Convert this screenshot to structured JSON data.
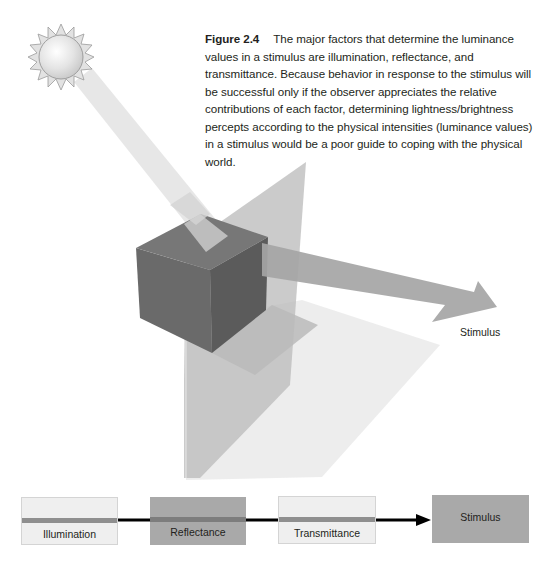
{
  "caption": {
    "figure_label": "Figure 2.4",
    "text": "The major factors that determine the luminance values in a stimulus are illumination, reflectance, and transmittance. Because behavior in response to the stimulus will be successful only if the observer appreciates the relative contributions of each factor, determining lightness/brightness percepts according to the physical intensities (luminance values) in a stimulus would be a poor guide to coping with the physical world."
  },
  "scene": {
    "light_source": "sun-icon",
    "objects": [
      "light-beam",
      "cube",
      "transparent-pane",
      "floor-shadow",
      "stimulus-arrow"
    ],
    "arrow_label": "Stimulus"
  },
  "flow": {
    "boxes": [
      {
        "label": "Illumination",
        "style": "light"
      },
      {
        "label": "Reflectance",
        "style": "dark"
      },
      {
        "label": "Transmittance",
        "style": "light"
      },
      {
        "label": "Stimulus",
        "style": "dark"
      }
    ]
  },
  "colors": {
    "light_box": "#efefef",
    "dark_box": "#a9a9a9",
    "cube_front": "#6a6a6a",
    "cube_right": "#5c5c5c",
    "cube_top": "#787878",
    "arrow": "#a6a6a6",
    "connector": "#000000"
  }
}
